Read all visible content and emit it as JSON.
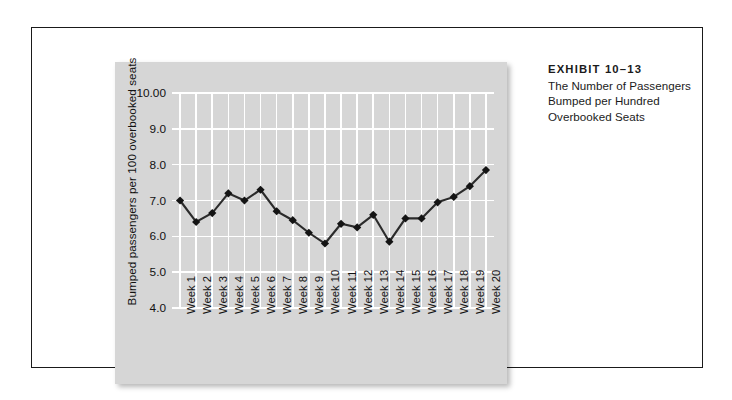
{
  "caption": {
    "eyebrow": "EXHIBIT 10–13",
    "lines": [
      "The Number of Passengers",
      "Bumped per Hundred",
      "Overbooked Seats"
    ]
  },
  "chart_data": {
    "type": "line",
    "title": "The Number of Passengers Bumped per Hundred Overbooked Seats",
    "xlabel": "",
    "ylabel": "Bumped passengers per 100 overbooked seats",
    "categories": [
      "Week 1",
      "Week 2",
      "Week 3",
      "Week 4",
      "Week 5",
      "Week 6",
      "Week 7",
      "Week 8",
      "Week 9",
      "Week 10",
      "Week 11",
      "Week 12",
      "Week 13",
      "Week 14",
      "Week 15",
      "Week 16",
      "Week 17",
      "Week 18",
      "Week 19",
      "Week 20"
    ],
    "values": [
      7.0,
      6.4,
      6.65,
      7.2,
      7.0,
      7.3,
      6.7,
      6.45,
      6.1,
      5.8,
      6.35,
      6.25,
      6.6,
      5.85,
      6.5,
      6.5,
      6.95,
      7.1,
      7.4,
      7.85
    ],
    "ytick_labels": [
      "10.00",
      "9.0",
      "8.0",
      "7.0",
      "6.0",
      "5.0",
      "4.0"
    ],
    "ytick_values": [
      10,
      9,
      8,
      7,
      6,
      5,
      4
    ],
    "ylim": [
      4.0,
      10.0
    ],
    "grid": true,
    "legend": false,
    "marker": "diamond",
    "line_color": "#2b2b2b",
    "marker_color": "#141414",
    "plot_background": "#d6d6d6",
    "grid_color": "#ffffff"
  }
}
